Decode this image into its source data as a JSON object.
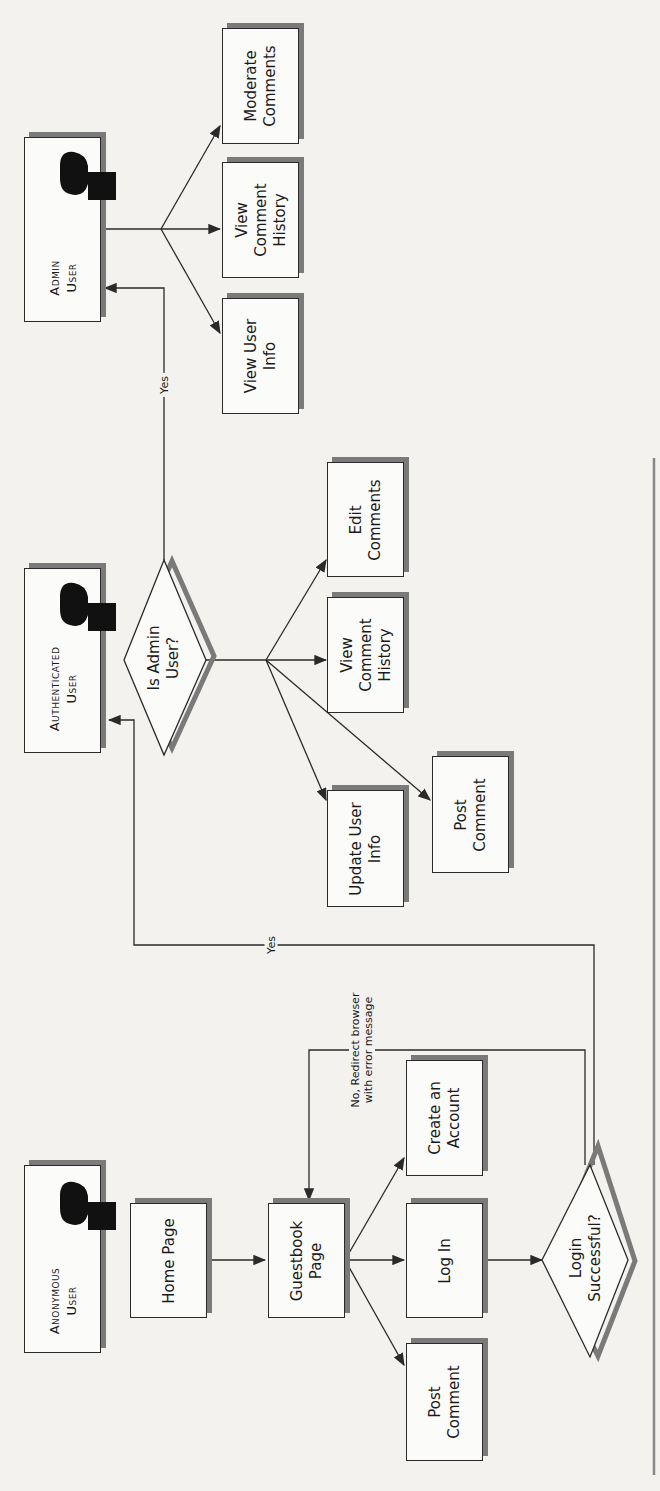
{
  "actors": {
    "anonymous": {
      "label": "Anonymous\nUser"
    },
    "authenticated": {
      "label": "Authenticated\nUser"
    },
    "admin": {
      "label": "Admin\nUser"
    }
  },
  "nodes": {
    "home_page": "Home Page",
    "guestbook_page": "Guestbook\nPage",
    "anon_post_comment": "Post\nComment",
    "log_in": "Log In",
    "create_account": "Create an\nAccount",
    "login_successful": "Login\nSuccessful?",
    "is_admin_user": "Is Admin\nUser?",
    "update_user_info": "Update User\nInfo",
    "auth_post_comment": "Post\nComment",
    "auth_view_comment_history": "View\nComment\nHistory",
    "edit_comments": "Edit\nComments",
    "view_user_info": "View User\nInfo",
    "admin_view_comment_history": "View\nComment\nHistory",
    "moderate_comments": "Moderate\nComments"
  },
  "edges": {
    "login_yes": "Yes",
    "login_no": "No, Redirect browser\nwith error message",
    "admin_yes": "Yes"
  },
  "colors": {
    "line": "#2a2a2a",
    "shadow": "#7a7a7a",
    "background": "#f3f2ef"
  }
}
